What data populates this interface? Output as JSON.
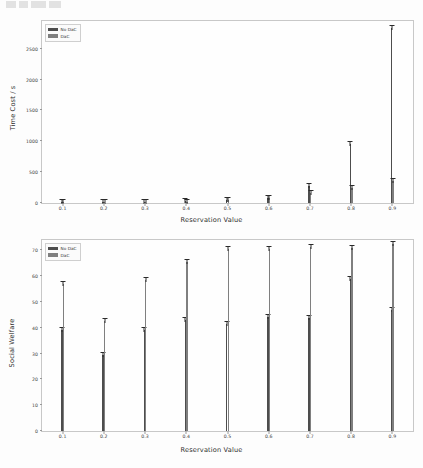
{
  "page": {
    "background_color": "#fdfdfd",
    "watermark": ""
  },
  "colors": {
    "series_no_dac": "#4d4d4d",
    "series_dac": "#7f7f7f",
    "axis": "#3c3c3c",
    "frame": "#c8c8c8",
    "error_bar": "#2a2a2a"
  },
  "chart_data": [
    {
      "type": "bar",
      "id": "time-cost-chart",
      "title": "",
      "xlabel": "Reservation Value",
      "ylabel": "Time Cost / s",
      "categories": [
        "0.1",
        "0.2",
        "0.3",
        "0.4",
        "0.5",
        "0.6",
        "0.7",
        "0.8",
        "0.9"
      ],
      "yticks": [
        0,
        500,
        1000,
        1500,
        2000,
        2500
      ],
      "ytick_labels": [
        "0",
        "500",
        "1000",
        "1500",
        "2000",
        "2500"
      ],
      "ylim": [
        0,
        2950
      ],
      "grid": false,
      "legend_position": "upper-left",
      "series": [
        {
          "name": "No DaC",
          "color": "#4d4d4d",
          "values": [
            10,
            14,
            20,
            28,
            48,
            88,
            272,
            963,
            2843
          ],
          "errors": [
            2,
            3,
            4,
            5,
            7,
            9,
            14,
            22,
            35
          ]
        },
        {
          "name": "DaC",
          "color": "#7f7f7f",
          "values": [
            9,
            12,
            16,
            22,
            45,
            84,
            165,
            243,
            362
          ],
          "errors": [
            2,
            2,
            3,
            4,
            6,
            8,
            10,
            14,
            18
          ]
        }
      ]
    },
    {
      "type": "bar",
      "id": "social-welfare-chart",
      "title": "",
      "xlabel": "Reservation Value",
      "ylabel": "Social Welfare",
      "categories": [
        "0.1",
        "0.2",
        "0.3",
        "0.4",
        "0.5",
        "0.6",
        "0.7",
        "0.8",
        "0.9"
      ],
      "yticks": [
        0,
        10,
        20,
        30,
        40,
        50,
        60,
        70
      ],
      "ytick_labels": [
        "0",
        "10",
        "20",
        "30",
        "40",
        "50",
        "60",
        "70"
      ],
      "ylim": [
        0,
        74
      ],
      "grid": false,
      "legend_position": "upper-left",
      "series": [
        {
          "name": "No DaC",
          "color": "#4d4d4d",
          "values": [
            39.2,
            29.6,
            39.1,
            42.9,
            41.3,
            44.2,
            43.7,
            58.9,
            46.9
          ],
          "errors": [
            0.5,
            0.5,
            0.5,
            0.5,
            0.5,
            0.5,
            0.5,
            0.5,
            0.5
          ]
        },
        {
          "name": "DaC",
          "color": "#7f7f7f",
          "values": [
            57.1,
            42.5,
            58.7,
            65.5,
            70.6,
            70.4,
            71.2,
            70.8,
            72.5
          ],
          "errors": [
            0.4,
            0.4,
            0.4,
            0.4,
            0.4,
            0.4,
            0.4,
            0.4,
            0.4
          ]
        }
      ]
    }
  ]
}
